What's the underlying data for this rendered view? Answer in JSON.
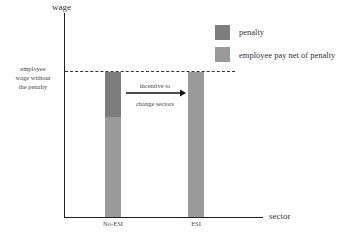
{
  "axes": {
    "y_label": "wage",
    "x_label": "sector",
    "reference_line_label": "employee wage without the penalty",
    "reference_line_lines": [
      "employee",
      "wage without",
      "the penalty"
    ]
  },
  "legend": {
    "items": [
      {
        "label": "penalty",
        "color": "#7d7d7d"
      },
      {
        "label": "employee pay net of penalty",
        "color": "#9a9a9a"
      }
    ]
  },
  "bars": [
    {
      "category": "No-ESI",
      "segments": [
        {
          "name": "employee pay net of penalty",
          "color": "#9a9a9a"
        },
        {
          "name": "penalty",
          "color": "#7d7d7d"
        }
      ]
    },
    {
      "category": "ESI",
      "segments": [
        {
          "name": "employee pay net of penalty",
          "color": "#9a9a9a"
        }
      ]
    }
  ],
  "annotation": {
    "line1": "incentive to",
    "line2": "change sectors",
    "direction": "No-ESI → ESI"
  }
}
